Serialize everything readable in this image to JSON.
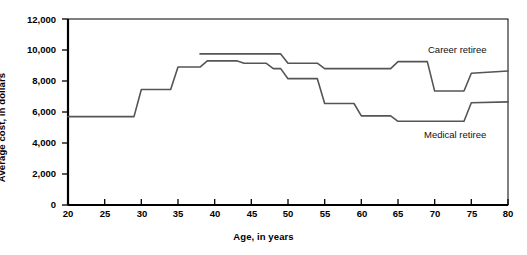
{
  "chart_data": {
    "type": "line",
    "title": "",
    "xlabel": "Age, in years",
    "ylabel": "Average cost, in dollars",
    "xlim": [
      20,
      80
    ],
    "ylim": [
      0,
      12000
    ],
    "xticks": [
      20,
      25,
      30,
      35,
      40,
      45,
      50,
      55,
      60,
      65,
      70,
      75,
      80
    ],
    "xtick_labels": [
      "20",
      "25",
      "30",
      "35",
      "40",
      "45",
      "50",
      "55",
      "60",
      "65",
      "70",
      "75",
      "80"
    ],
    "yticks": [
      0,
      2000,
      4000,
      6000,
      8000,
      10000,
      12000
    ],
    "ytick_labels": [
      "0",
      "2,000",
      "4,000",
      "6,000",
      "8,000",
      "10,000",
      "12,000"
    ],
    "grid": false,
    "legend_position": "inline-right",
    "line_color": "#555555",
    "axis_color": "#000000",
    "series": [
      {
        "name": "Career retiree",
        "label_text": "Career retiree",
        "style": "step",
        "x": [
          38,
          49,
          50,
          54,
          55,
          59,
          60,
          64,
          65,
          69,
          70,
          74,
          75,
          80
        ],
        "values": [
          9750,
          9750,
          9150,
          9150,
          8800,
          8800,
          8800,
          8800,
          9250,
          9250,
          7350,
          7350,
          8500,
          8650
        ]
      },
      {
        "name": "Medical retiree",
        "label_text": "Medical retiree",
        "style": "step",
        "x": [
          20,
          29,
          30,
          34,
          35,
          38,
          39,
          43,
          44,
          47,
          48,
          49,
          50,
          54,
          55,
          59,
          60,
          64,
          65,
          69,
          70,
          74,
          75,
          80
        ],
        "values": [
          5700,
          5700,
          7450,
          7450,
          8900,
          8900,
          9300,
          9300,
          9150,
          9150,
          8800,
          8800,
          8150,
          8150,
          6550,
          6550,
          5750,
          5750,
          5400,
          5400,
          5400,
          5400,
          6600,
          6650
        ]
      }
    ],
    "annotations": [
      {
        "name": "career-retiree-label",
        "text": "Career retiree",
        "x_px": 428,
        "y_px": 44
      },
      {
        "name": "medical-retiree-label",
        "text": "Medical retiree",
        "x_px": 424,
        "y_px": 129
      }
    ]
  }
}
